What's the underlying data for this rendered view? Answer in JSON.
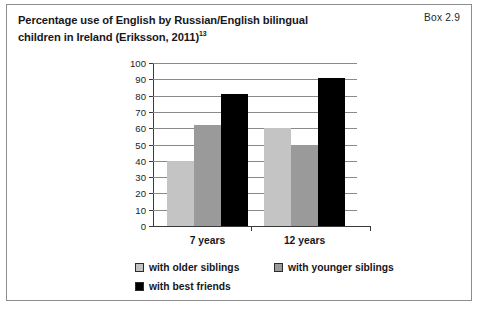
{
  "box": {
    "title": "Percentage use of English by Russian/English bilingual children in Ireland (Eriksson, 2011)",
    "title_superscript": "13",
    "label": "Box 2.9"
  },
  "chart_data": {
    "type": "bar",
    "title": "Percentage use of English by Russian/English bilingual children in Ireland (Eriksson, 2011)",
    "categories": [
      "7 years",
      "12 years"
    ],
    "series": [
      {
        "name": "with older siblings",
        "values": [
          40,
          60
        ],
        "color": "#c4c4c4"
      },
      {
        "name": "with younger siblings",
        "values": [
          62,
          50
        ],
        "color": "#9a9a9a"
      },
      {
        "name": "with best friends",
        "values": [
          81,
          91
        ],
        "color": "#000000"
      }
    ],
    "xlabel": "",
    "ylabel": "",
    "ylim": [
      0,
      100
    ],
    "ytick_step": 10,
    "yticks": [
      100,
      90,
      80,
      70,
      60,
      50,
      40,
      30,
      20,
      10,
      0
    ],
    "grid": true,
    "legend_position": "bottom"
  }
}
